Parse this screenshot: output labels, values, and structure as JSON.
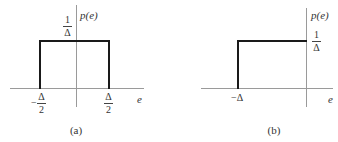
{
  "panels": [
    {
      "id": "a",
      "caption": "(a)",
      "y_label": "p(e)",
      "x_label": "e",
      "height_label": {
        "num": "1",
        "den": "Δ"
      },
      "left_tick": {
        "sign": "−",
        "num": "Δ",
        "den": "2"
      },
      "right_tick": {
        "num": "Δ",
        "den": "2"
      }
    },
    {
      "id": "b",
      "caption": "(b)",
      "y_label": "p(e)",
      "x_label": "e",
      "height_label": {
        "num": "1",
        "den": "Δ"
      },
      "left_tick": {
        "text": "−Δ"
      }
    }
  ],
  "figure_data": {
    "type": "diagram",
    "description": "Uniform probability density functions of quantization error",
    "panels": [
      {
        "id": "a",
        "shape": "rectangle",
        "x_range": [
          "-Δ/2",
          "Δ/2"
        ],
        "height": "1/Δ",
        "caption": "(a)"
      },
      {
        "id": "b",
        "shape": "rectangle",
        "x_range": [
          "-Δ",
          "0"
        ],
        "height": "1/Δ",
        "caption": "(b)"
      }
    ]
  }
}
